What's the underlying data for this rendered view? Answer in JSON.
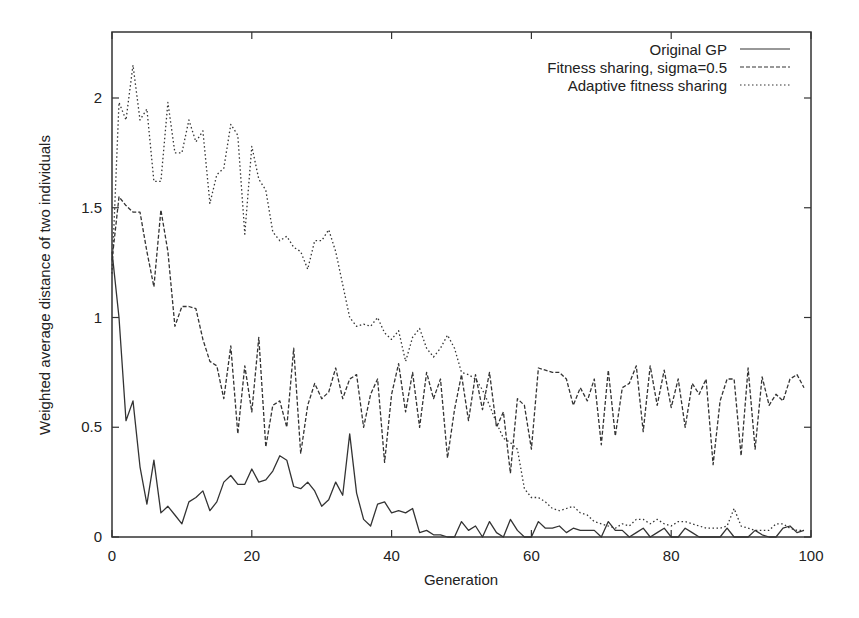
{
  "chart_data": {
    "type": "line",
    "title": "",
    "xlabel": "Generation",
    "ylabel": "Weighted average distance of two individuals",
    "xlim": [
      0,
      100
    ],
    "ylim": [
      0,
      2.3
    ],
    "xticks": [
      0,
      20,
      40,
      60,
      80,
      100
    ],
    "yticks": [
      0,
      0.5,
      1,
      1.5,
      2
    ],
    "xtick_labels": [
      "0",
      "20",
      "40",
      "60",
      "80",
      "100"
    ],
    "ytick_labels": [
      "0",
      "0.5",
      "1",
      "1.5",
      "2"
    ],
    "grid": false,
    "legend_position": "top-right",
    "series": [
      {
        "name": "Original GP",
        "style": "solid",
        "values": [
          1.3,
          1.0,
          0.53,
          0.62,
          0.32,
          0.15,
          0.35,
          0.11,
          0.14,
          0.1,
          0.06,
          0.16,
          0.18,
          0.21,
          0.12,
          0.16,
          0.25,
          0.28,
          0.24,
          0.24,
          0.31,
          0.25,
          0.26,
          0.3,
          0.37,
          0.35,
          0.23,
          0.22,
          0.25,
          0.21,
          0.14,
          0.17,
          0.25,
          0.19,
          0.47,
          0.2,
          0.08,
          0.05,
          0.15,
          0.16,
          0.11,
          0.12,
          0.11,
          0.13,
          0.02,
          0.03,
          0.01,
          0.01,
          0.0,
          0.0,
          0.07,
          0.03,
          0.05,
          0.0,
          0.07,
          0.02,
          0.0,
          0.08,
          0.03,
          0.0,
          0.0,
          0.07,
          0.04,
          0.04,
          0.05,
          0.02,
          0.04,
          0.03,
          0.03,
          0.03,
          0.0,
          0.07,
          0.03,
          0.03,
          0.0,
          0.02,
          0.04,
          0.0,
          0.02,
          0.04,
          0.0,
          0.0,
          0.04,
          0.02,
          0.0,
          0.0,
          0.0,
          0.0,
          0.04,
          0.0,
          0.0,
          0.0,
          0.03,
          0.01,
          0.0,
          0.0,
          0.04,
          0.05,
          0.02,
          0.03
        ]
      },
      {
        "name": "Fitness sharing, sigma=0.5",
        "style": "dashed",
        "values": [
          1.26,
          1.55,
          1.51,
          1.48,
          1.48,
          1.3,
          1.14,
          1.49,
          1.3,
          0.96,
          1.05,
          1.05,
          1.04,
          0.9,
          0.8,
          0.78,
          0.63,
          0.87,
          0.47,
          0.78,
          0.57,
          0.91,
          0.41,
          0.6,
          0.62,
          0.5,
          0.86,
          0.38,
          0.6,
          0.7,
          0.63,
          0.66,
          0.77,
          0.63,
          0.72,
          0.74,
          0.5,
          0.65,
          0.72,
          0.34,
          0.65,
          0.79,
          0.57,
          0.75,
          0.5,
          0.75,
          0.63,
          0.72,
          0.36,
          0.58,
          0.74,
          0.53,
          0.74,
          0.58,
          0.75,
          0.5,
          0.57,
          0.29,
          0.63,
          0.6,
          0.4,
          0.77,
          0.76,
          0.75,
          0.75,
          0.72,
          0.6,
          0.68,
          0.62,
          0.72,
          0.42,
          0.76,
          0.46,
          0.68,
          0.7,
          0.78,
          0.48,
          0.78,
          0.6,
          0.76,
          0.59,
          0.72,
          0.5,
          0.7,
          0.65,
          0.72,
          0.33,
          0.62,
          0.72,
          0.72,
          0.37,
          0.77,
          0.4,
          0.73,
          0.6,
          0.65,
          0.62,
          0.72,
          0.74,
          0.68
        ]
      },
      {
        "name": "Adaptive fitness sharing",
        "style": "dotted",
        "values": [
          1.2,
          1.98,
          1.9,
          2.15,
          1.9,
          1.95,
          1.62,
          1.62,
          1.98,
          1.75,
          1.75,
          1.9,
          1.8,
          1.85,
          1.52,
          1.65,
          1.68,
          1.88,
          1.83,
          1.38,
          1.78,
          1.63,
          1.58,
          1.39,
          1.35,
          1.37,
          1.32,
          1.3,
          1.22,
          1.35,
          1.35,
          1.4,
          1.3,
          1.15,
          1.0,
          0.96,
          0.97,
          0.96,
          1.0,
          0.93,
          0.9,
          0.94,
          0.8,
          0.91,
          0.95,
          0.86,
          0.82,
          0.86,
          0.92,
          0.86,
          0.75,
          0.74,
          0.72,
          0.67,
          0.6,
          0.52,
          0.45,
          0.43,
          0.4,
          0.22,
          0.18,
          0.18,
          0.16,
          0.13,
          0.12,
          0.13,
          0.14,
          0.11,
          0.1,
          0.07,
          0.06,
          0.05,
          0.04,
          0.06,
          0.05,
          0.08,
          0.08,
          0.06,
          0.08,
          0.06,
          0.05,
          0.07,
          0.07,
          0.06,
          0.05,
          0.04,
          0.04,
          0.04,
          0.05,
          0.13,
          0.05,
          0.04,
          0.03,
          0.03,
          0.03,
          0.06,
          0.06,
          0.04,
          0.03,
          0.03
        ]
      }
    ],
    "x": [
      0,
      1,
      2,
      3,
      4,
      5,
      6,
      7,
      8,
      9,
      10,
      11,
      12,
      13,
      14,
      15,
      16,
      17,
      18,
      19,
      20,
      21,
      22,
      23,
      24,
      25,
      26,
      27,
      28,
      29,
      30,
      31,
      32,
      33,
      34,
      35,
      36,
      37,
      38,
      39,
      40,
      41,
      42,
      43,
      44,
      45,
      46,
      47,
      48,
      49,
      50,
      51,
      52,
      53,
      54,
      55,
      56,
      57,
      58,
      59,
      60,
      61,
      62,
      63,
      64,
      65,
      66,
      67,
      68,
      69,
      70,
      71,
      72,
      73,
      74,
      75,
      76,
      77,
      78,
      79,
      80,
      81,
      82,
      83,
      84,
      85,
      86,
      87,
      88,
      89,
      90,
      91,
      92,
      93,
      94,
      95,
      96,
      97,
      98,
      99
    ]
  },
  "legend": {
    "items": [
      {
        "label": "Original GP"
      },
      {
        "label": "Fitness sharing, sigma=0.5"
      },
      {
        "label": "Adaptive fitness sharing"
      }
    ]
  },
  "axes": {
    "xlabel": "Generation",
    "ylabel": "Weighted average distance of two individuals"
  },
  "colors": {
    "line": "#333333",
    "axis": "#333333",
    "text": "#222222",
    "background": "#ffffff"
  }
}
